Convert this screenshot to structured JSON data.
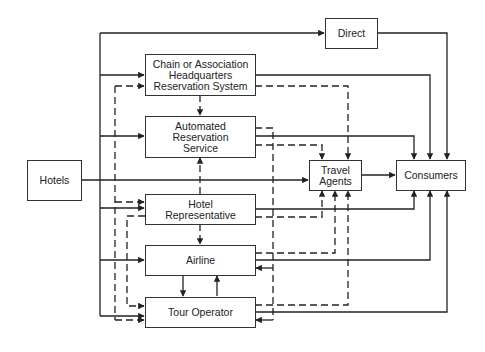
{
  "nodes": {
    "hotels": {
      "label": "Hotels"
    },
    "direct": {
      "label": "Direct"
    },
    "chain": {
      "label": "Chain or Association\nHeadquarters\nReservation System"
    },
    "ars": {
      "label": "Automated\nReservation\nService"
    },
    "hotel_rep": {
      "label": "Hotel\nRepresentative"
    },
    "airline": {
      "label": "Airline"
    },
    "tour_operator": {
      "label": "Tour Operator"
    },
    "travel_agents": {
      "label": "Travel\nAgents"
    },
    "consumers": {
      "label": "Consumers"
    }
  },
  "edges": [
    {
      "from": "Hotels",
      "to": "Direct",
      "style": "solid"
    },
    {
      "from": "Hotels",
      "to": "Chain or Association Headquarters Reservation System",
      "style": "solid"
    },
    {
      "from": "Hotels",
      "to": "Automated Reservation Service",
      "style": "solid"
    },
    {
      "from": "Hotels",
      "to": "Travel Agents",
      "style": "solid"
    },
    {
      "from": "Hotels",
      "to": "Hotel Representative",
      "style": "solid"
    },
    {
      "from": "Hotels",
      "to": "Airline",
      "style": "solid"
    },
    {
      "from": "Hotels",
      "to": "Tour Operator",
      "style": "solid"
    },
    {
      "from": "Direct",
      "to": "Consumers",
      "style": "solid"
    },
    {
      "from": "Chain or Association Headquarters Reservation System",
      "to": "Consumers",
      "style": "solid"
    },
    {
      "from": "Chain or Association Headquarters Reservation System",
      "to": "Travel Agents",
      "style": "dashed"
    },
    {
      "from": "Chain or Association Headquarters Reservation System",
      "to": "Automated Reservation Service",
      "style": "dashed"
    },
    {
      "from": "Automated Reservation Service",
      "to": "Consumers",
      "style": "solid"
    },
    {
      "from": "Automated Reservation Service",
      "to": "Travel Agents",
      "style": "dashed"
    },
    {
      "from": "Hotel Representative",
      "to": "Automated Reservation Service",
      "style": "dashed"
    },
    {
      "from": "Hotel Representative",
      "to": "Consumers",
      "style": "solid"
    },
    {
      "from": "Hotel Representative",
      "to": "Travel Agents",
      "style": "dashed"
    },
    {
      "from": "Hotel Representative",
      "to": "Airline",
      "style": "dashed"
    },
    {
      "from": "Hotel Representative",
      "to": "Tour Operator",
      "style": "dashed"
    },
    {
      "from": "Airline",
      "to": "Consumers",
      "style": "solid"
    },
    {
      "from": "Airline",
      "to": "Travel Agents",
      "style": "dashed"
    },
    {
      "from": "Airline",
      "to": "Tour Operator",
      "style": "solid"
    },
    {
      "from": "Tour Operator",
      "to": "Airline",
      "style": "solid"
    },
    {
      "from": "Tour Operator",
      "to": "Consumers",
      "style": "solid"
    },
    {
      "from": "Tour Operator",
      "to": "Travel Agents",
      "style": "dashed"
    },
    {
      "from": "Travel Agents",
      "to": "Consumers",
      "style": "solid"
    }
  ],
  "colors": {
    "line": "#222222",
    "box_border": "#333333",
    "background": "#ffffff"
  }
}
